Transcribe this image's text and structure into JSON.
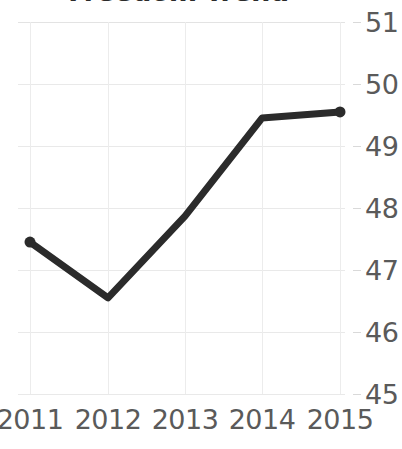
{
  "chart_data": {
    "type": "line",
    "title": "Freedom Trend",
    "xlabel": "",
    "ylabel": "",
    "categories": [
      "2011",
      "2012",
      "2013",
      "2014",
      "2015"
    ],
    "x": [
      2011,
      2012,
      2013,
      2014,
      2015
    ],
    "values": [
      47.45,
      46.55,
      47.87,
      49.45,
      49.55
    ],
    "series": [
      {
        "name": "Freedom Trend",
        "values": [
          47.45,
          46.55,
          47.87,
          49.45,
          49.55
        ]
      }
    ],
    "ylim": [
      45,
      51
    ],
    "yticks": [
      45,
      46,
      47,
      48,
      49,
      50,
      51
    ],
    "ytick_labels": [
      "45",
      "46",
      "47",
      "48",
      "49",
      "50",
      "51"
    ],
    "y_axis_position": "right",
    "grid": true,
    "legend": false,
    "legend_position": "none",
    "line_color": "#2b2b2b",
    "line_width_px": 7,
    "marker": "circle",
    "grid_color": "#e9e9e9",
    "label_color": "#5a5a5a",
    "title_color": "#2b2b2b",
    "annotations": [],
    "note_title_clipped": true
  }
}
